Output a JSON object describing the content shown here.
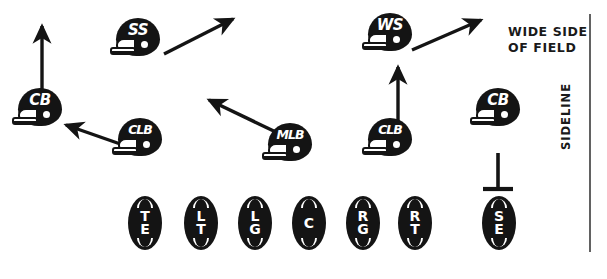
{
  "diagram": {
    "type": "football-play-diagram",
    "width": 607,
    "height": 279,
    "ink_color": "#141414",
    "background_color": "#ffffff"
  },
  "field_labels": {
    "wide_side": "WIDE SIDE\nOF FIELD",
    "sideline": "SIDELINE"
  },
  "defenders": [
    {
      "id": "cb-left",
      "label": "CB",
      "x": 12,
      "y": 88,
      "position_name": "Cornerback"
    },
    {
      "id": "ss",
      "label": "SS",
      "x": 110,
      "y": 18,
      "position_name": "Strong Safety"
    },
    {
      "id": "clb-left",
      "label": "CLB",
      "x": 112,
      "y": 118,
      "position_name": "Corner Linebacker"
    },
    {
      "id": "mlb",
      "label": "MLB",
      "x": 262,
      "y": 123,
      "position_name": "Middle Linebacker"
    },
    {
      "id": "ws",
      "label": "WS",
      "x": 362,
      "y": 13,
      "position_name": "Weak Safety"
    },
    {
      "id": "clb-right",
      "label": "CLB",
      "x": 362,
      "y": 118,
      "position_name": "Corner Linebacker"
    },
    {
      "id": "cb-right",
      "label": "CB",
      "x": 470,
      "y": 88,
      "position_name": "Cornerback"
    }
  ],
  "offense": [
    {
      "id": "te",
      "label": [
        "T",
        "E"
      ],
      "x": 128,
      "y": 196,
      "position_name": "Tight End"
    },
    {
      "id": "lt",
      "label": [
        "L",
        "T"
      ],
      "x": 184,
      "y": 196,
      "position_name": "Left Tackle"
    },
    {
      "id": "lg",
      "label": [
        "L",
        "G"
      ],
      "x": 238,
      "y": 196,
      "position_name": "Left Guard"
    },
    {
      "id": "c",
      "label": [
        "C"
      ],
      "x": 292,
      "y": 196,
      "position_name": "Center"
    },
    {
      "id": "rg",
      "label": [
        "R",
        "G"
      ],
      "x": 346,
      "y": 196,
      "position_name": "Right Guard"
    },
    {
      "id": "rt",
      "label": [
        "R",
        "T"
      ],
      "x": 398,
      "y": 196,
      "position_name": "Right Tackle"
    },
    {
      "id": "se",
      "label": [
        "S",
        "E"
      ],
      "x": 482,
      "y": 196,
      "position_name": "Split End"
    }
  ],
  "movement_arrows": [
    {
      "id": "arrow-cb-left-up",
      "from": "cb-left",
      "kind": "arrow",
      "direction": "up",
      "x1": 42,
      "y1": 95,
      "x2": 42,
      "y2": 24
    },
    {
      "id": "arrow-clb-left",
      "from": "clb-left",
      "kind": "arrow",
      "direction": "up-left",
      "x1": 126,
      "y1": 146,
      "x2": 63,
      "y2": 124
    },
    {
      "id": "arrow-ss",
      "from": "ss",
      "kind": "arrow",
      "direction": "up-right",
      "x1": 164,
      "y1": 54,
      "x2": 236,
      "y2": 17
    },
    {
      "id": "arrow-mlb",
      "from": "mlb",
      "kind": "arrow",
      "direction": "up-left",
      "x1": 278,
      "y1": 134,
      "x2": 206,
      "y2": 98
    },
    {
      "id": "arrow-clb-right-up",
      "from": "clb-right",
      "kind": "arrow",
      "direction": "up",
      "x1": 398,
      "y1": 125,
      "x2": 398,
      "y2": 65
    },
    {
      "id": "arrow-ws",
      "from": "ws",
      "kind": "arrow",
      "direction": "up-right",
      "x1": 412,
      "y1": 50,
      "x2": 484,
      "y2": 18
    },
    {
      "id": "route-se-hook",
      "from": "se",
      "kind": "hook-route",
      "direction": "up-stop",
      "x1": 498,
      "y1": 190,
      "x2": 498,
      "y2": 152
    }
  ]
}
